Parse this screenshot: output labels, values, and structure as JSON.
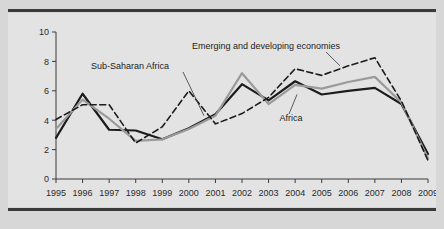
{
  "figure": {
    "background_color": "#d7d7d7",
    "plot_background_color": "#e3e3e3",
    "rule_color": "#3a3a3a",
    "watermark_text": "AFRICAN ECONOMIC"
  },
  "chart_data": {
    "type": "line",
    "title": "",
    "subtitle": "",
    "xlabel": "",
    "ylabel": "",
    "x": [
      1995,
      1996,
      1997,
      1998,
      1999,
      2000,
      2001,
      2002,
      2003,
      2004,
      2005,
      2006,
      2007,
      2008,
      2009
    ],
    "categories": [
      "1995",
      "1996",
      "1997",
      "1998",
      "1999",
      "2000",
      "2001",
      "2002",
      "2003",
      "2004",
      "2005",
      "2006",
      "2007",
      "2008",
      "2009"
    ],
    "xlim": [
      1995,
      2009
    ],
    "ylim": [
      0,
      10
    ],
    "yticks": [
      0,
      2,
      4,
      6,
      8,
      10
    ],
    "ytick_labels": [
      "0",
      "2",
      "4",
      "6",
      "8",
      "10"
    ],
    "grid": false,
    "legend_position": "inline-annotations",
    "series": [
      {
        "name": "Africa",
        "style": "solid",
        "color": "#1c1c1c",
        "width": 2.2,
        "values": [
          2.8,
          5.8,
          3.35,
          3.3,
          2.7,
          3.45,
          4.4,
          6.45,
          5.35,
          6.65,
          5.75,
          6.0,
          6.2,
          5.1,
          1.7
        ]
      },
      {
        "name": "Sub-Saharan Africa",
        "style": "solid",
        "color": "#9a9a9a",
        "width": 2.2,
        "values": [
          3.4,
          5.4,
          4.1,
          2.6,
          2.7,
          3.4,
          4.3,
          7.2,
          5.1,
          6.4,
          6.15,
          6.6,
          6.95,
          5.2,
          1.4
        ]
      },
      {
        "name": "Emerging and developing economies",
        "style": "dashed",
        "color": "#1c1c1c",
        "width": 1.6,
        "values": [
          4.05,
          5.05,
          5.05,
          2.45,
          3.55,
          6.0,
          3.75,
          4.45,
          5.55,
          7.5,
          7.05,
          7.7,
          8.25,
          5.3,
          1.25
        ]
      }
    ],
    "annotations": [
      {
        "text": "Sub-Saharan Africa",
        "for": "Sub-Saharan Africa"
      },
      {
        "text": "Emerging and developing economies",
        "for": "Emerging and developing economies"
      },
      {
        "text": "Africa",
        "for": "Africa"
      }
    ]
  }
}
